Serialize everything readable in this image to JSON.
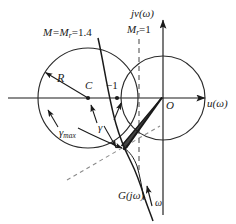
{
  "figure": {
    "kind": "nyquist-plot-with-m-circles",
    "axes": {
      "imaginary_axis_label": "jv(ω)",
      "real_axis_label": "u(ω)",
      "origin_label": "O"
    },
    "labels": {
      "m_circle_big": "M=M",
      "m_circle_big_sub": "r",
      "m_circle_big_val": "=1.4",
      "m_circle_unit": "M",
      "m_circle_unit_sub": "r",
      "m_circle_unit_val": "=1",
      "radius": "R",
      "center": "C",
      "critical_point": "−1",
      "gamma_max": "γ",
      "gamma_max_sub": "max",
      "gamma": "γ",
      "transfer_function": "G(jω)",
      "omega": "ω"
    },
    "colors": {
      "ink": "#1a1a1a",
      "stroke": "#2b2b2b",
      "background": "#ffffff"
    },
    "geometry": {
      "m_circle_big": {
        "cx": 88,
        "cy": 98,
        "r": 50
      },
      "m_circle_unit": {
        "cx": 163,
        "cy": 98,
        "r": 42
      },
      "center_point_C": {
        "x": 88,
        "y": 98
      },
      "minus_one_point": {
        "x": 117,
        "y": 98
      },
      "origin": {
        "x": 163,
        "y": 98
      },
      "real_axis_y": 98,
      "imag_axis_x": 163,
      "dashed_vertical_x": 139
    }
  }
}
